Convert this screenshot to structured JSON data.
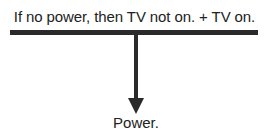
{
  "diagram": {
    "premises": {
      "text": "If no power, then TV not on. + TV on.",
      "items": [
        "If no power, then TV not on.",
        "TV on."
      ],
      "connector": "+"
    },
    "inference_arrow": {
      "direction": "down",
      "color": "#2a2a2a"
    },
    "conclusion": {
      "text": "Power."
    }
  }
}
